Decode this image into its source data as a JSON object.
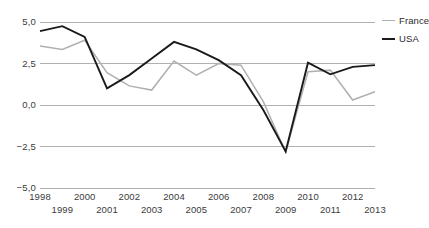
{
  "chart_data": {
    "type": "line",
    "title": "",
    "xlabel": "",
    "ylabel": "",
    "ylim": [
      -5.0,
      5.0
    ],
    "yticks": [
      5.0,
      2.5,
      0.0,
      -2.5,
      -5.0
    ],
    "ytick_labels": [
      "5,0",
      "2,5",
      "0,0",
      "−2,5",
      "−5,0"
    ],
    "grid": true,
    "legend_position": "right",
    "x": [
      1998,
      1999,
      2000,
      2001,
      2002,
      2003,
      2004,
      2005,
      2006,
      2007,
      2008,
      2009,
      2010,
      2011,
      2012,
      2013
    ],
    "xtick_labels": [
      "1998",
      "1999",
      "2000",
      "2001",
      "2002",
      "2003",
      "2004",
      "2005",
      "2006",
      "2007",
      "2008",
      "2009",
      "2010",
      "2011",
      "2012",
      "2013"
    ],
    "series": [
      {
        "name": "France",
        "color": "#b0b0b0",
        "values": [
          3.55,
          3.35,
          3.9,
          1.95,
          1.15,
          0.9,
          2.65,
          1.8,
          2.5,
          2.4,
          0.2,
          -2.85,
          2.0,
          2.1,
          0.3,
          0.8
        ]
      },
      {
        "name": "USA",
        "color": "#1a1a1a",
        "values": [
          4.45,
          4.75,
          4.1,
          1.0,
          1.8,
          2.8,
          3.8,
          3.35,
          2.7,
          1.8,
          -0.3,
          -2.8,
          2.55,
          1.85,
          2.3,
          2.4
        ]
      }
    ]
  },
  "legend": {
    "entries": [
      {
        "label": "France"
      },
      {
        "label": "USA"
      }
    ]
  }
}
